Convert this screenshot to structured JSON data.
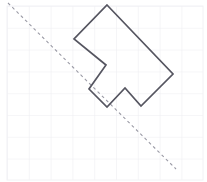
{
  "canvas": {
    "width": 207,
    "height": 182,
    "background_color": "#ffffff"
  },
  "grid": {
    "label": "square grid background",
    "line_color": "#ededf1",
    "line_width": 1.1,
    "cell_size": 21.8,
    "origin_x": 7,
    "origin_y": 6,
    "columns": 9,
    "rows": 8,
    "bounds": {
      "left": 7,
      "top": 6,
      "right": 203,
      "bottom": 180
    }
  },
  "mirror_line": {
    "label": "dashed line of reflection",
    "color": "#9a9aa5",
    "stroke_width": 1.1,
    "dash_pattern": "3 3",
    "x1": 8,
    "y1": 3,
    "x2": 176,
    "y2": 169,
    "angle_degrees": 45
  },
  "shape": {
    "label": "arrow polygon",
    "stroke_color": "#555560",
    "stroke_width": 1.7,
    "fill": "none",
    "vertex_count": 8,
    "points": "107,5 173,74 141,106 125,88 107,107 89,89 106,65 74,39",
    "vertices": [
      {
        "name": "apex-top",
        "x": 107,
        "y": 5
      },
      {
        "name": "right-point",
        "x": 173,
        "y": 74
      },
      {
        "name": "tab-right-bottom",
        "x": 141,
        "y": 106
      },
      {
        "name": "tab-peak",
        "x": 125,
        "y": 88
      },
      {
        "name": "tab-left-bottom",
        "x": 107,
        "y": 107
      },
      {
        "name": "notch-outer-left",
        "x": 89,
        "y": 89
      },
      {
        "name": "notch-inner-point",
        "x": 106,
        "y": 65
      },
      {
        "name": "left-point",
        "x": 74,
        "y": 39
      }
    ]
  },
  "frame": {
    "label": "outer image frame",
    "color": "#f2f2f5",
    "stroke_width": 1
  }
}
